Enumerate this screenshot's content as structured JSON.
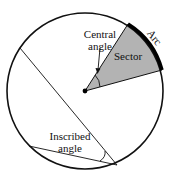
{
  "diagram": {
    "labels": {
      "central_line1": "Central",
      "central_line2": "angle",
      "sector": "Sector",
      "arc": "Arc",
      "inscribed_line1": "Inscribed",
      "inscribed_line2": "angle"
    },
    "colors": {
      "sector_fill": "#b3b3b3",
      "stroke": "#111111",
      "background": "#ffffff"
    }
  }
}
